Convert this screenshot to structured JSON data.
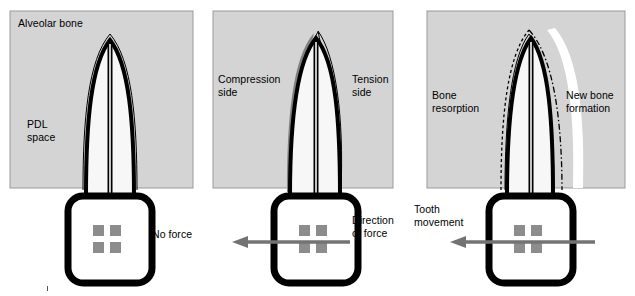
{
  "figure": {
    "type": "diagram",
    "width": 635,
    "height": 296,
    "background": "#ffffff"
  },
  "colors": {
    "bone_fill": "#d4d4d4",
    "bone_stroke": "#9a9a9a",
    "tooth_outline": "#000000",
    "tooth_fill": "#f7f7f7",
    "pdl_line": "#000000",
    "compression_shadow": "#808080",
    "bracket_square": "#8c8c8c",
    "arrow": "#737373",
    "text": "#000000",
    "dashed_outline": "#000000"
  },
  "panels": [
    {
      "id": "panel-no-force",
      "index": 1,
      "state": "no force",
      "bone_box": {
        "x": 10,
        "y": 11,
        "width": 183,
        "height": 177
      },
      "labels": [
        {
          "name": "alveolar-bone-label",
          "text": "Alveolar bone",
          "x": 18,
          "y": 18,
          "align": "left"
        },
        {
          "name": "pdl-space-label",
          "text": "PDL\nspace",
          "x": 27,
          "y": 119,
          "align": "left"
        },
        {
          "name": "no-force-label",
          "text": "No force",
          "x": 152,
          "y": 228,
          "align": "left"
        }
      ],
      "arrow": null,
      "dashed_outline": false,
      "compression_shadow": false
    },
    {
      "id": "panel-force-applied",
      "index": 2,
      "state": "force applied",
      "bone_box": {
        "x": 213,
        "y": 11,
        "width": 180,
        "height": 177
      },
      "labels": [
        {
          "name": "compression-side-label",
          "text": "Compression\nside",
          "x": 218,
          "y": 74,
          "align": "left"
        },
        {
          "name": "tension-side-label",
          "text": "Tension\nside",
          "x": 352,
          "y": 74,
          "align": "left"
        },
        {
          "name": "direction-of-force-label",
          "text": "Direction\nof force",
          "x": 352,
          "y": 215,
          "align": "left"
        }
      ],
      "arrow": {
        "name": "direction-of-force-arrow",
        "x_tail": 348,
        "x_head": 235,
        "y": 242,
        "direction": "left"
      },
      "dashed_outline": false,
      "compression_shadow": true
    },
    {
      "id": "panel-bone-remodeling",
      "index": 3,
      "state": "bone remodeling",
      "bone_box": {
        "x": 427,
        "y": 11,
        "width": 198,
        "height": 177
      },
      "labels": [
        {
          "name": "bone-resorption-label",
          "text": "Bone\nresorption",
          "x": 432,
          "y": 90,
          "align": "left"
        },
        {
          "name": "new-bone-formation-label",
          "text": "New bone\nformation",
          "x": 566,
          "y": 90,
          "align": "left"
        },
        {
          "name": "tooth-movement-label",
          "text": "Tooth\nmovement",
          "x": 415,
          "y": 204,
          "align": "left"
        }
      ],
      "arrow": {
        "name": "tooth-movement-arrow",
        "x_tail": 592,
        "x_head": 450,
        "y": 242,
        "direction": "left"
      },
      "dashed_outline": true,
      "compression_shadow": false
    }
  ],
  "tooth": {
    "crown": {
      "name": "tooth-crown",
      "description": "rounded-rectangle crown with thick black outline",
      "corner_radius": 14,
      "border_width": 7
    },
    "bracket_squares": {
      "name": "bracket-squares",
      "count": 4,
      "size": 11,
      "color": "#8c8c8c"
    },
    "root": {
      "name": "tooth-root",
      "description": "tapered root with pulp canal and surrounding PDL space line"
    },
    "pulp_canal": {
      "name": "pulp-canal",
      "description": "narrow central canal running down the root"
    }
  },
  "annotations": {
    "stray_mark": {
      "name": "stray-tick-mark",
      "x": 47,
      "y": 288
    }
  }
}
